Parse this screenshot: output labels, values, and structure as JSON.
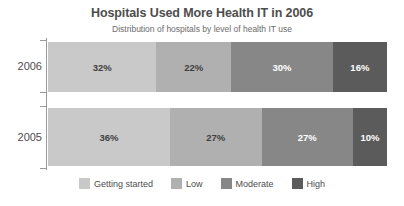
{
  "chart_data": {
    "type": "bar",
    "title": "Hospitals Used More Health IT in 2006",
    "subtitle": "Distribution of hospitals by level of health IT use",
    "orientation": "horizontal",
    "stacked": true,
    "normalized_percent": true,
    "xlabel": "",
    "ylabel": "",
    "xlim": [
      0,
      100
    ],
    "grid": false,
    "legend_position": "bottom",
    "categories": [
      "2006",
      "2005"
    ],
    "series": [
      {
        "name": "Getting started",
        "color": "#c9c9c9",
        "text_color": "#3f3f3f",
        "values": [
          32,
          36
        ],
        "labels": [
          "32%",
          "36%"
        ]
      },
      {
        "name": "Low",
        "color": "#b0b0b0",
        "text_color": "#3f3f3f",
        "values": [
          22,
          27
        ],
        "labels": [
          "22%",
          "27%"
        ]
      },
      {
        "name": "Moderate",
        "color": "#878787",
        "text_color": "#ffffff",
        "values": [
          30,
          27
        ],
        "labels": [
          "30%",
          "27%"
        ]
      },
      {
        "name": "High",
        "color": "#5b5b5b",
        "text_color": "#ffffff",
        "values": [
          16,
          10
        ],
        "labels": [
          "16%",
          "10%"
        ]
      }
    ]
  },
  "titles": {
    "main": "Hospitals Used More Health IT in 2006",
    "sub": "Distribution of hospitals by level of health IT use"
  },
  "axis": {
    "year_2006": "2006",
    "year_2005": "2005"
  },
  "bars": {
    "row_2006": [
      {
        "label": "32%",
        "pct": 32,
        "color": "#c9c9c9",
        "text_color": "#3f3f3f"
      },
      {
        "label": "22%",
        "pct": 22,
        "color": "#b0b0b0",
        "text_color": "#3f3f3f"
      },
      {
        "label": "30%",
        "pct": 30,
        "color": "#878787",
        "text_color": "#ffffff"
      },
      {
        "label": "16%",
        "pct": 16,
        "color": "#5b5b5b",
        "text_color": "#ffffff"
      }
    ],
    "row_2005": [
      {
        "label": "36%",
        "pct": 36,
        "color": "#c9c9c9",
        "text_color": "#3f3f3f"
      },
      {
        "label": "27%",
        "pct": 27,
        "color": "#b0b0b0",
        "text_color": "#3f3f3f"
      },
      {
        "label": "27%",
        "pct": 27,
        "color": "#878787",
        "text_color": "#ffffff"
      },
      {
        "label": "10%",
        "pct": 10,
        "color": "#5b5b5b",
        "text_color": "#ffffff"
      }
    ]
  },
  "legend": {
    "items": [
      {
        "label": "Getting started",
        "color": "#c9c9c9"
      },
      {
        "label": "Low",
        "color": "#b0b0b0"
      },
      {
        "label": "Moderate",
        "color": "#878787"
      },
      {
        "label": "High",
        "color": "#5b5b5b"
      }
    ]
  }
}
